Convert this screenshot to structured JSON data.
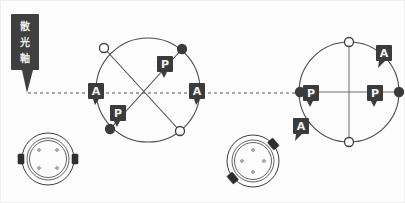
{
  "diagram": {
    "callout": {
      "name": "astigmatism-axis-callout",
      "text": "散光軸",
      "chars": [
        "散",
        "光",
        "軸"
      ],
      "bg_color": "#3f3f3f",
      "text_color": "#ededed"
    },
    "axis": {
      "label": "horizontal-reference-axis",
      "style": "dashed",
      "color": "#555555",
      "y": 93,
      "x_start": 28,
      "x_end": 320
    },
    "badge_colors": {
      "background": "#3b3b3b",
      "text": "#f2f2f2"
    },
    "node_colors": {
      "open": "#ffffff",
      "filled": "#3b3b3b",
      "stroke": "#3b3b3b"
    },
    "panels": [
      {
        "name": "left-diagram",
        "caption": "",
        "circle": {
          "cx": 148,
          "cy": 90,
          "r": 52
        },
        "markers": [
          {
            "id": "left-node-top-left",
            "type": "open",
            "cx": 104,
            "cy": 48
          },
          {
            "id": "left-node-top-right",
            "type": "filled",
            "cx": 182,
            "cy": 49
          },
          {
            "id": "left-node-bottom-left",
            "type": "filled",
            "cx": 110,
            "cy": 129
          },
          {
            "id": "left-node-bottom-right",
            "type": "open",
            "cx": 180,
            "cy": 131
          }
        ],
        "chords": [
          {
            "id": "chord-a",
            "x1": 104,
            "y1": 48,
            "x2": 180,
            "y2": 131
          },
          {
            "id": "chord-b",
            "x1": 182,
            "y1": 49,
            "x2": 110,
            "y2": 129
          }
        ],
        "badges": [
          {
            "id": "left-badge-a-west",
            "label": "A",
            "x": 88,
            "y": 83,
            "tail": "down"
          },
          {
            "id": "left-badge-a-east",
            "label": "A",
            "x": 189,
            "y": 83,
            "tail": "down"
          },
          {
            "id": "left-badge-p-upper",
            "label": "P",
            "x": 157,
            "y": 56,
            "tail": "down-right"
          },
          {
            "id": "left-badge-p-lower",
            "label": "P",
            "x": 110,
            "y": 105,
            "tail": "down-right"
          }
        ]
      },
      {
        "name": "right-diagram",
        "caption": "",
        "circle": {
          "cx": 349,
          "cy": 92,
          "r": 50
        },
        "markers": [
          {
            "id": "right-node-top",
            "type": "open",
            "cx": 349,
            "cy": 42
          },
          {
            "id": "right-node-bottom",
            "type": "open",
            "cx": 349,
            "cy": 142
          },
          {
            "id": "right-node-west",
            "type": "filled",
            "cx": 300,
            "cy": 92
          },
          {
            "id": "right-node-east",
            "type": "filled",
            "cx": 399,
            "cy": 92
          }
        ],
        "chords": [
          {
            "id": "right-vertical-axis",
            "x1": 349,
            "y1": 42,
            "x2": 349,
            "y2": 142
          },
          {
            "id": "right-horizontal-axis",
            "x1": 300,
            "y1": 92,
            "x2": 399,
            "y2": 92
          }
        ],
        "badges": [
          {
            "id": "right-badge-p-west",
            "label": "P",
            "x": 303,
            "y": 85,
            "tail": "down"
          },
          {
            "id": "right-badge-p-east",
            "label": "P",
            "x": 367,
            "y": 85,
            "tail": "down"
          },
          {
            "id": "right-badge-a-ne",
            "label": "A",
            "x": 376,
            "y": 45,
            "tail": "down-left"
          },
          {
            "id": "right-badge-a-sw",
            "label": "A",
            "x": 293,
            "y": 118,
            "tail": "down-left"
          }
        ]
      }
    ],
    "lenses": [
      {
        "name": "contact-lens-aligned",
        "cx": 48,
        "cy": 159,
        "rotation_deg": 0,
        "tab_positions": [
          "west",
          "east"
        ],
        "dot_count": 4,
        "description": "toric contact lens, stabilization tabs horizontal"
      },
      {
        "name": "contact-lens-rotated",
        "cx": 253,
        "cy": 161,
        "rotation_deg": 38,
        "tab_positions": [
          "north-east",
          "south-west"
        ],
        "dot_count": 4,
        "description": "toric contact lens, stabilization tabs rotated off axis"
      }
    ]
  }
}
